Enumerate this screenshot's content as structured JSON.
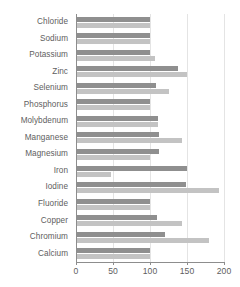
{
  "chart_data": {
    "type": "bar",
    "orientation": "horizontal",
    "title": "",
    "xlabel": "",
    "ylabel": "",
    "xlim": [
      0,
      200
    ],
    "xticks": [
      0,
      50,
      100,
      150,
      200
    ],
    "xtick_labels": [
      "0",
      "50",
      "100",
      "150",
      "200"
    ],
    "grid": true,
    "grid_axis": "x",
    "legend": "none",
    "categories": [
      "Chloride",
      "Sodium",
      "Potassium",
      "Zinc",
      "Selenium",
      "Phosphorus",
      "Molybdenum",
      "Manganese",
      "Magnesium",
      "Iron",
      "Iodine",
      "Fluoride",
      "Copper",
      "Chromium",
      "Calcium"
    ],
    "series": [
      {
        "name": "series-1",
        "color": "#8f8f8f",
        "values": [
          100,
          100,
          100,
          138,
          108,
          100,
          111,
          112,
          112,
          150,
          148,
          100,
          110,
          120,
          100
        ]
      },
      {
        "name": "series-2",
        "color": "#c3c3c3",
        "values": [
          100,
          100,
          107,
          150,
          125,
          100,
          111,
          143,
          100,
          47,
          193,
          100,
          143,
          180,
          100
        ]
      }
    ]
  },
  "colors": {
    "series_1": "#8f8f8f",
    "series_2": "#c3c3c3",
    "axis": "#8d8d8d",
    "grid": "#e4e4e4",
    "text": "#5e5e5e",
    "background": "#ffffff"
  }
}
